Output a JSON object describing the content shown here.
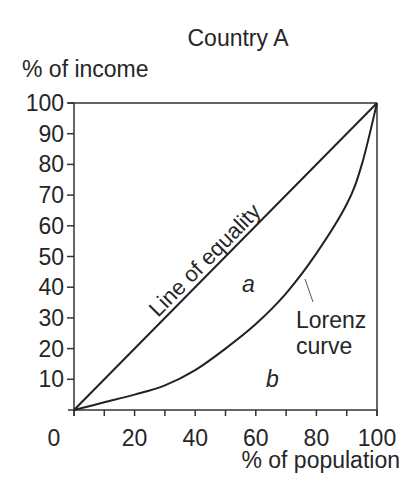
{
  "chart_data": {
    "type": "line",
    "title": "Country A",
    "xlabel": "% of population",
    "ylabel": "% of income",
    "xlim": [
      0,
      100
    ],
    "ylim": [
      0,
      100
    ],
    "grid": false,
    "x_ticks": [
      0,
      10,
      20,
      30,
      40,
      50,
      60,
      70,
      80,
      90,
      100
    ],
    "x_tick_labels": [
      "0",
      "20",
      "40",
      "60",
      "80",
      "100"
    ],
    "y_ticks": [
      0,
      10,
      20,
      30,
      40,
      50,
      60,
      70,
      80,
      90,
      100
    ],
    "y_tick_labels": [
      "10",
      "20",
      "30",
      "40",
      "50",
      "60",
      "70",
      "80",
      "90",
      "100"
    ],
    "series": [
      {
        "name": "Line of equality",
        "x": [
          0,
          100
        ],
        "y": [
          0,
          100
        ]
      },
      {
        "name": "Lorenz curve",
        "x": [
          0,
          10,
          20,
          30,
          40,
          50,
          60,
          70,
          80,
          90,
          95,
          100
        ],
        "y": [
          0,
          2.5,
          5,
          8,
          13,
          20,
          28,
          38,
          51,
          67,
          80,
          100
        ]
      }
    ],
    "annotations": [
      {
        "text": "Line of equality",
        "note": "rotated along diagonal"
      },
      {
        "text": "a",
        "note": "area between line of equality and Lorenz curve"
      },
      {
        "text": "b",
        "note": "area under Lorenz curve"
      },
      {
        "text": "Lorenz curve",
        "note": "label with pointer to curve"
      }
    ]
  },
  "labels": {
    "title": "Country A",
    "ylabel": "% of income",
    "xlabel": "% of population",
    "equality": "Line of equality",
    "area_a": "a",
    "area_b": "b",
    "lorenz_line1": "Lorenz",
    "lorenz_line2": "curve",
    "x_zero": "0"
  }
}
